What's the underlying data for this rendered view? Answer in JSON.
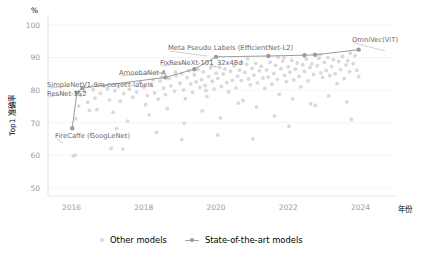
{
  "chart_data": {
    "type": "scatter",
    "title": "",
    "subtitle": "",
    "xlabel": "年份",
    "ylabel": "Top1 准确率",
    "yunit": "%",
    "xlim": [
      2015.35,
      2024.9
    ],
    "ylim": [
      47.5,
      101.5
    ],
    "xticks": [
      2016,
      2018,
      2020,
      2022,
      2024
    ],
    "xticklabels": [
      "2016",
      "2018",
      "2020",
      "2022",
      "2024"
    ],
    "yticks": [
      50,
      60,
      70,
      80,
      90,
      100
    ],
    "yticklabels": [
      "50",
      "60",
      "70",
      "80",
      "90",
      "100"
    ],
    "grid": true,
    "legend_position": "bottom-center",
    "legend": [
      {
        "name": "Other models",
        "marker": "dot",
        "color": "#d9d9d9"
      },
      {
        "name": "State-of-the-art models",
        "marker": "line-dot",
        "color": "#9b9b9b"
      }
    ],
    "series": [
      {
        "name": "State-of-the-art models",
        "color": "#9b9b9b",
        "points": [
          {
            "x": 2016.02,
            "y": 68.3,
            "label": "FireCaffe (GoogLeNet)"
          },
          {
            "x": 2016.15,
            "y": 79.2,
            "label": "ResNet-152"
          },
          {
            "x": 2016.3,
            "y": 80.6,
            "label": "SimpleNetV1-9m-correct-labels"
          },
          {
            "x": 2018.6,
            "y": 83.9,
            "label": "AmoebaNet-A"
          },
          {
            "x": 2019.4,
            "y": 86.4,
            "label": "FixResNeXt-101_32x48d"
          },
          {
            "x": 2020.0,
            "y": 90.2,
            "label": "Meta Pseudo Labels (EfficientNet-L2)"
          },
          {
            "x": 2021.45,
            "y": 90.45,
            "label": ""
          },
          {
            "x": 2022.45,
            "y": 90.7,
            "label": ""
          },
          {
            "x": 2022.75,
            "y": 90.8,
            "label": ""
          },
          {
            "x": 2023.95,
            "y": 92.4,
            "label": "OmniVec(ViT)"
          }
        ]
      },
      {
        "name": "Other models",
        "color": "#d9d9d9",
        "points": [
          {
            "x": 2016.1,
            "y": 60.0
          },
          {
            "x": 2016.12,
            "y": 71.2
          },
          {
            "x": 2016.2,
            "y": 75.1
          },
          {
            "x": 2016.25,
            "y": 78.4
          },
          {
            "x": 2016.35,
            "y": 79.6
          },
          {
            "x": 2016.45,
            "y": 76.2
          },
          {
            "x": 2016.5,
            "y": 73.8
          },
          {
            "x": 2016.6,
            "y": 80.1
          },
          {
            "x": 2016.65,
            "y": 77.5
          },
          {
            "x": 2016.7,
            "y": 74.0
          },
          {
            "x": 2016.8,
            "y": 79.0
          },
          {
            "x": 2016.9,
            "y": 81.2
          },
          {
            "x": 2017.0,
            "y": 80.4
          },
          {
            "x": 2017.05,
            "y": 77.0
          },
          {
            "x": 2017.1,
            "y": 62.1
          },
          {
            "x": 2017.15,
            "y": 73.2
          },
          {
            "x": 2017.2,
            "y": 79.8
          },
          {
            "x": 2017.3,
            "y": 81.0
          },
          {
            "x": 2017.35,
            "y": 76.6
          },
          {
            "x": 2017.45,
            "y": 78.9
          },
          {
            "x": 2017.5,
            "y": 82.0
          },
          {
            "x": 2017.6,
            "y": 80.2
          },
          {
            "x": 2017.7,
            "y": 77.8
          },
          {
            "x": 2017.8,
            "y": 79.4
          },
          {
            "x": 2017.9,
            "y": 82.4
          },
          {
            "x": 2018.0,
            "y": 80.9
          },
          {
            "x": 2018.05,
            "y": 75.5
          },
          {
            "x": 2018.1,
            "y": 78.3
          },
          {
            "x": 2018.2,
            "y": 81.7
          },
          {
            "x": 2018.25,
            "y": 83.1
          },
          {
            "x": 2018.3,
            "y": 79.1
          },
          {
            "x": 2018.4,
            "y": 77.2
          },
          {
            "x": 2018.45,
            "y": 82.8
          },
          {
            "x": 2018.5,
            "y": 84.0
          },
          {
            "x": 2018.55,
            "y": 80.6
          },
          {
            "x": 2018.6,
            "y": 78.6
          },
          {
            "x": 2018.7,
            "y": 83.5
          },
          {
            "x": 2018.75,
            "y": 81.3
          },
          {
            "x": 2018.85,
            "y": 79.7
          },
          {
            "x": 2018.9,
            "y": 84.4
          },
          {
            "x": 2019.0,
            "y": 82.1
          },
          {
            "x": 2019.05,
            "y": 85.0
          },
          {
            "x": 2019.1,
            "y": 80.0
          },
          {
            "x": 2019.15,
            "y": 77.4
          },
          {
            "x": 2019.2,
            "y": 83.8
          },
          {
            "x": 2019.25,
            "y": 86.0
          },
          {
            "x": 2019.3,
            "y": 81.9
          },
          {
            "x": 2019.35,
            "y": 79.3
          },
          {
            "x": 2019.4,
            "y": 84.7
          },
          {
            "x": 2019.45,
            "y": 82.5
          },
          {
            "x": 2019.5,
            "y": 86.3
          },
          {
            "x": 2019.55,
            "y": 80.8
          },
          {
            "x": 2019.6,
            "y": 83.2
          },
          {
            "x": 2019.65,
            "y": 85.6
          },
          {
            "x": 2019.7,
            "y": 81.4
          },
          {
            "x": 2019.75,
            "y": 78.0
          },
          {
            "x": 2019.8,
            "y": 84.1
          },
          {
            "x": 2019.85,
            "y": 86.8
          },
          {
            "x": 2019.9,
            "y": 82.7
          },
          {
            "x": 2019.95,
            "y": 80.3
          },
          {
            "x": 2020.0,
            "y": 85.2
          },
          {
            "x": 2020.05,
            "y": 83.6
          },
          {
            "x": 2020.1,
            "y": 87.0
          },
          {
            "x": 2020.15,
            "y": 81.1
          },
          {
            "x": 2020.2,
            "y": 84.9
          },
          {
            "x": 2020.25,
            "y": 86.5
          },
          {
            "x": 2020.3,
            "y": 82.3
          },
          {
            "x": 2020.35,
            "y": 79.5
          },
          {
            "x": 2020.4,
            "y": 85.8
          },
          {
            "x": 2020.45,
            "y": 83.0
          },
          {
            "x": 2020.5,
            "y": 87.4
          },
          {
            "x": 2020.55,
            "y": 80.7
          },
          {
            "x": 2020.6,
            "y": 84.3
          },
          {
            "x": 2020.65,
            "y": 86.1
          },
          {
            "x": 2020.7,
            "y": 82.9
          },
          {
            "x": 2020.75,
            "y": 76.8
          },
          {
            "x": 2020.8,
            "y": 85.4
          },
          {
            "x": 2020.85,
            "y": 87.9
          },
          {
            "x": 2020.9,
            "y": 83.4
          },
          {
            "x": 2020.95,
            "y": 81.6
          },
          {
            "x": 2021.0,
            "y": 86.7
          },
          {
            "x": 2021.05,
            "y": 84.6
          },
          {
            "x": 2021.1,
            "y": 88.2
          },
          {
            "x": 2021.15,
            "y": 82.2
          },
          {
            "x": 2021.2,
            "y": 85.9
          },
          {
            "x": 2021.25,
            "y": 87.3
          },
          {
            "x": 2021.3,
            "y": 83.7
          },
          {
            "x": 2021.35,
            "y": 80.5
          },
          {
            "x": 2021.4,
            "y": 86.2
          },
          {
            "x": 2021.45,
            "y": 84.0
          },
          {
            "x": 2021.5,
            "y": 88.6
          },
          {
            "x": 2021.55,
            "y": 81.8
          },
          {
            "x": 2021.6,
            "y": 85.1
          },
          {
            "x": 2021.65,
            "y": 87.6
          },
          {
            "x": 2021.7,
            "y": 83.3
          },
          {
            "x": 2021.75,
            "y": 78.7
          },
          {
            "x": 2021.8,
            "y": 86.6
          },
          {
            "x": 2021.85,
            "y": 88.9
          },
          {
            "x": 2021.9,
            "y": 84.5
          },
          {
            "x": 2021.95,
            "y": 82.6
          },
          {
            "x": 2022.0,
            "y": 87.1
          },
          {
            "x": 2022.05,
            "y": 85.5
          },
          {
            "x": 2022.1,
            "y": 89.1
          },
          {
            "x": 2022.15,
            "y": 83.1
          },
          {
            "x": 2022.2,
            "y": 86.4
          },
          {
            "x": 2022.25,
            "y": 88.3
          },
          {
            "x": 2022.3,
            "y": 84.2
          },
          {
            "x": 2022.35,
            "y": 81.0
          },
          {
            "x": 2022.4,
            "y": 87.8
          },
          {
            "x": 2022.45,
            "y": 85.7
          },
          {
            "x": 2022.5,
            "y": 89.5
          },
          {
            "x": 2022.55,
            "y": 82.8
          },
          {
            "x": 2022.6,
            "y": 86.9
          },
          {
            "x": 2022.65,
            "y": 88.0
          },
          {
            "x": 2022.7,
            "y": 84.8
          },
          {
            "x": 2022.75,
            "y": 75.3
          },
          {
            "x": 2022.8,
            "y": 87.5
          },
          {
            "x": 2022.85,
            "y": 89.8
          },
          {
            "x": 2022.9,
            "y": 85.3
          },
          {
            "x": 2022.95,
            "y": 83.9
          },
          {
            "x": 2023.0,
            "y": 88.5
          },
          {
            "x": 2023.05,
            "y": 86.0
          },
          {
            "x": 2023.1,
            "y": 90.0
          },
          {
            "x": 2023.15,
            "y": 84.4
          },
          {
            "x": 2023.2,
            "y": 87.2
          },
          {
            "x": 2023.25,
            "y": 89.3
          },
          {
            "x": 2023.3,
            "y": 85.0
          },
          {
            "x": 2023.35,
            "y": 82.0
          },
          {
            "x": 2023.4,
            "y": 88.8
          },
          {
            "x": 2023.45,
            "y": 86.3
          },
          {
            "x": 2023.5,
            "y": 90.3
          },
          {
            "x": 2023.55,
            "y": 83.5
          },
          {
            "x": 2023.6,
            "y": 87.7
          },
          {
            "x": 2023.65,
            "y": 89.0
          },
          {
            "x": 2023.7,
            "y": 85.6
          },
          {
            "x": 2023.75,
            "y": 71.0
          },
          {
            "x": 2023.8,
            "y": 88.1
          },
          {
            "x": 2023.85,
            "y": 90.6
          },
          {
            "x": 2023.9,
            "y": 86.1
          },
          {
            "x": 2023.95,
            "y": 84.1
          },
          {
            "x": 2016.55,
            "y": 66.5
          },
          {
            "x": 2017.25,
            "y": 68.2
          },
          {
            "x": 2017.55,
            "y": 70.5
          },
          {
            "x": 2018.15,
            "y": 72.4
          },
          {
            "x": 2018.65,
            "y": 74.3
          },
          {
            "x": 2019.12,
            "y": 69.8
          },
          {
            "x": 2019.62,
            "y": 73.6
          },
          {
            "x": 2020.12,
            "y": 71.5
          },
          {
            "x": 2020.62,
            "y": 76.0
          },
          {
            "x": 2021.12,
            "y": 74.8
          },
          {
            "x": 2021.62,
            "y": 72.1
          },
          {
            "x": 2022.12,
            "y": 77.3
          },
          {
            "x": 2022.62,
            "y": 75.8
          },
          {
            "x": 2023.12,
            "y": 78.2
          },
          {
            "x": 2023.62,
            "y": 76.4
          },
          {
            "x": 2018.35,
            "y": 67.0
          },
          {
            "x": 2019.05,
            "y": 64.8
          },
          {
            "x": 2020.05,
            "y": 66.2
          },
          {
            "x": 2021.02,
            "y": 65.0
          },
          {
            "x": 2022.02,
            "y": 68.9
          },
          {
            "x": 2016.05,
            "y": 59.8
          },
          {
            "x": 2017.42,
            "y": 61.9
          },
          {
            "x": 2019.72,
            "y": 79.9
          },
          {
            "x": 2020.72,
            "y": 88.4
          },
          {
            "x": 2021.72,
            "y": 90.1
          },
          {
            "x": 2022.72,
            "y": 91.0
          },
          {
            "x": 2023.72,
            "y": 91.3
          },
          {
            "x": 2020.88,
            "y": 89.6
          },
          {
            "x": 2021.88,
            "y": 89.9
          },
          {
            "x": 2022.88,
            "y": 90.9
          },
          {
            "x": 2019.88,
            "y": 87.6
          },
          {
            "x": 2018.88,
            "y": 85.5
          }
        ]
      }
    ],
    "annotations": [
      {
        "text": "FireCaffe (GoogLeNet)",
        "tx": 55,
        "ty": 138,
        "px": 63,
        "py": 143,
        "anchor": "start"
      },
      {
        "text": "ResNet-152",
        "tx": 47,
        "ty": 96,
        "px": 66,
        "py": 93,
        "anchor": "start"
      },
      {
        "text": "SimpleNetV1-9m-correct-labels",
        "tx": 47,
        "ty": 87,
        "px": 69,
        "py": 86,
        "anchor": "start"
      },
      {
        "text": "AmoebaNet-A",
        "tx": 119,
        "ty": 75,
        "px": 165,
        "py": 72,
        "anchor": "start"
      },
      {
        "text": "FixResNeXt-101_32x48d",
        "tx": 160,
        "ty": 65,
        "px": 186,
        "py": 63,
        "anchor": "start"
      },
      {
        "text": "Meta Pseudo Labels (EfficientNet-L2)",
        "tx": 168,
        "ty": 50,
        "px": 207,
        "py": 56,
        "anchor": "start"
      },
      {
        "text": "OmniVec(ViT)",
        "tx": 352,
        "ty": 42,
        "px": 385,
        "py": 51,
        "anchor": "start"
      }
    ]
  }
}
